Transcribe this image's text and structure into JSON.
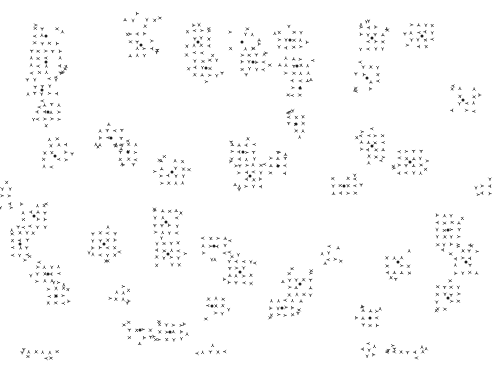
{
  "artwork": {
    "title": "Generative Glyph Aggregation Pattern",
    "type": "procedural-glyph-scatter",
    "canvas": {
      "width": 498,
      "height": 370
    },
    "background_color": "#ffffff",
    "mark_color": "#3a3a3a",
    "center_dot_color": "#1a1a1a",
    "cell_size": 7.2,
    "mark_stroke_width": 0.85,
    "center_dot_radius": 1.5,
    "mark_scale": 2.6,
    "cluster_span": 4,
    "cluster_fill_probability": 0.82,
    "rotation_steps": 4,
    "seed": 20250114,
    "clusters": [
      {
        "cx": 46,
        "cy": 36,
        "w": 4,
        "h": 3
      },
      {
        "cx": 46,
        "cy": 62,
        "w": 5,
        "h": 4
      },
      {
        "cx": 42,
        "cy": 90,
        "w": 5,
        "h": 4
      },
      {
        "cx": 48,
        "cy": 112,
        "w": 4,
        "h": 3
      },
      {
        "cx": 140,
        "cy": 20,
        "w": 5,
        "h": 1
      },
      {
        "cx": 141,
        "cy": 45,
        "w": 4,
        "h": 4
      },
      {
        "cx": 198,
        "cy": 42,
        "w": 4,
        "h": 4
      },
      {
        "cx": 206,
        "cy": 68,
        "w": 4,
        "h": 3
      },
      {
        "cx": 242,
        "cy": 42,
        "w": 4,
        "h": 3
      },
      {
        "cx": 253,
        "cy": 62,
        "w": 4,
        "h": 3
      },
      {
        "cx": 290,
        "cy": 40,
        "w": 4,
        "h": 3
      },
      {
        "cx": 297,
        "cy": 66,
        "w": 4,
        "h": 3
      },
      {
        "cx": 300,
        "cy": 88,
        "w": 3,
        "h": 3
      },
      {
        "cx": 372,
        "cy": 38,
        "w": 4,
        "h": 4
      },
      {
        "cx": 422,
        "cy": 36,
        "w": 4,
        "h": 4
      },
      {
        "cx": 367,
        "cy": 78,
        "w": 4,
        "h": 4
      },
      {
        "cx": 463,
        "cy": 100,
        "w": 4,
        "h": 4
      },
      {
        "cx": 296,
        "cy": 124,
        "w": 3,
        "h": 3
      },
      {
        "cx": 111,
        "cy": 138,
        "w": 4,
        "h": 3
      },
      {
        "cx": 55,
        "cy": 156,
        "w": 4,
        "h": 4
      },
      {
        "cx": 128,
        "cy": 152,
        "w": 3,
        "h": 3
      },
      {
        "cx": 172,
        "cy": 172,
        "w": 4,
        "h": 4
      },
      {
        "cx": 243,
        "cy": 152,
        "w": 4,
        "h": 3
      },
      {
        "cx": 250,
        "cy": 176,
        "w": 4,
        "h": 4
      },
      {
        "cx": 278,
        "cy": 166,
        "w": 3,
        "h": 3
      },
      {
        "cx": 344,
        "cy": 186,
        "w": 4,
        "h": 3
      },
      {
        "cx": 372,
        "cy": 146,
        "w": 4,
        "h": 4
      },
      {
        "cx": 410,
        "cy": 162,
        "w": 4,
        "h": 4
      },
      {
        "cx": 34,
        "cy": 216,
        "w": 4,
        "h": 4
      },
      {
        "cx": 20,
        "cy": 244,
        "w": 3,
        "h": 4
      },
      {
        "cx": 104,
        "cy": 244,
        "w": 4,
        "h": 4
      },
      {
        "cx": 166,
        "cy": 222,
        "w": 4,
        "h": 4
      },
      {
        "cx": 168,
        "cy": 254,
        "w": 4,
        "h": 4
      },
      {
        "cx": 214,
        "cy": 246,
        "w": 4,
        "h": 3
      },
      {
        "cx": 240,
        "cy": 272,
        "w": 4,
        "h": 4
      },
      {
        "cx": 300,
        "cy": 284,
        "w": 4,
        "h": 4
      },
      {
        "cx": 398,
        "cy": 262,
        "w": 4,
        "h": 4
      },
      {
        "cx": 448,
        "cy": 230,
        "w": 4,
        "h": 5
      },
      {
        "cx": 466,
        "cy": 262,
        "w": 4,
        "h": 4
      },
      {
        "cx": 48,
        "cy": 274,
        "w": 4,
        "h": 3
      },
      {
        "cx": 56,
        "cy": 296,
        "w": 3,
        "h": 3
      },
      {
        "cx": 140,
        "cy": 330,
        "w": 4,
        "h": 3
      },
      {
        "cx": 170,
        "cy": 332,
        "w": 4,
        "h": 3
      },
      {
        "cx": 212,
        "cy": 306,
        "w": 4,
        "h": 3
      },
      {
        "cx": 282,
        "cy": 308,
        "w": 4,
        "h": 3
      },
      {
        "cx": 370,
        "cy": 318,
        "w": 3,
        "h": 3
      },
      {
        "cx": 448,
        "cy": 298,
        "w": 4,
        "h": 4
      },
      {
        "cx": 43,
        "cy": 352,
        "w": 5,
        "h": 1
      },
      {
        "cx": 214,
        "cy": 352,
        "w": 4,
        "h": 1
      },
      {
        "cx": 408,
        "cy": 352,
        "w": 5,
        "h": 1
      },
      {
        "cx": 369,
        "cy": 350,
        "w": 1,
        "h": 1
      },
      {
        "cx": 388,
        "cy": 350,
        "w": 1,
        "h": 1
      },
      {
        "cx": 6,
        "cy": 196,
        "w": 2,
        "h": 3
      },
      {
        "cx": 486,
        "cy": 186,
        "w": 2,
        "h": 3
      },
      {
        "cx": 120,
        "cy": 296,
        "w": 2,
        "h": 2
      },
      {
        "cx": 332,
        "cy": 256,
        "w": 2,
        "h": 2
      }
    ]
  }
}
